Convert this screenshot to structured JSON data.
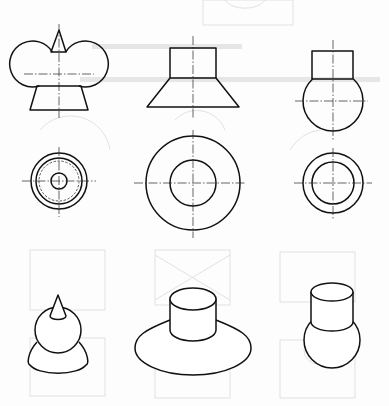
{
  "figure": {
    "colors": {
      "line": "#111111",
      "centerline": "#222222",
      "bleed_through": "#d9d9d9",
      "paper": "#fdfdfd"
    },
    "columns": [
      {
        "id": "A",
        "name": "cone-sphere-frustum",
        "front_view": {
          "cone": {
            "tip": [
              59,
              30
            ],
            "base_y": 52,
            "base_x": [
              51,
              66
            ]
          },
          "sphere": {
            "center": [
              59,
              74
            ],
            "r": 23
          },
          "frustum": {
            "top_y": 86,
            "top_x": [
              37,
              81
            ],
            "bottom_y": 110,
            "bottom_x": [
              30,
              88
            ]
          },
          "axis": {
            "x": 59,
            "y": [
              24,
              118
            ]
          },
          "hline": {
            "y": 74,
            "x": [
              24,
              94
            ]
          }
        },
        "top_view": {
          "center": [
            59,
            181
          ],
          "circles": [
            28,
            23,
            8
          ],
          "hidden_circle": 20,
          "hline": [
            22,
            96
          ],
          "vline": [
            147,
            217
          ]
        },
        "iso_view": {
          "cone_tip": [
            58,
            295
          ],
          "cone_base": {
            "c": [
              58,
              316
            ],
            "rx": 8,
            "ry": 3.5
          },
          "sphere": {
            "c": [
              58,
              330
            ],
            "r": 23
          },
          "frustum_bottom": {
            "c": [
              58,
              365
            ],
            "rx": 29,
            "ry": 11
          }
        }
      },
      {
        "id": "B",
        "name": "cylinder-on-frustum",
        "front_view": {
          "rect": {
            "x": [
              170,
              216
            ],
            "y": [
              48,
              78
            ]
          },
          "frustum": {
            "top_y": 78,
            "top_x": [
              170,
              216
            ],
            "bottom_y": 107,
            "bottom_x": [
              147,
              239
            ]
          },
          "axis": {
            "x": 193,
            "y": [
              36,
              119
            ]
          }
        },
        "top_view": {
          "center": [
            193,
            183
          ],
          "circles": [
            47,
            23
          ],
          "hline": [
            134,
            246
          ],
          "vline": [
            130,
            238
          ]
        },
        "iso_view": {
          "top": {
            "c": [
              193,
              299
            ],
            "rx": 23,
            "ry": 11
          },
          "cyl_bottom_y": 330,
          "base": {
            "c": [
              193,
              348
            ],
            "rx": 58,
            "ry": 27
          },
          "shoulder_y": 320
        }
      },
      {
        "id": "C",
        "name": "cylinder-on-sphere",
        "front_view": {
          "rect": {
            "x": [
              312,
              353
            ],
            "y": [
              51,
              79
            ]
          },
          "sphere": {
            "center": [
              333,
              101
            ],
            "r": 30
          },
          "axis": {
            "x": 333,
            "y": [
              40,
              140
            ]
          },
          "hline": {
            "y": 101,
            "x": [
              295,
              368
            ]
          }
        },
        "top_view": {
          "center": [
            333,
            183
          ],
          "circles": [
            30,
            21
          ],
          "hline": [
            294,
            372
          ],
          "vline": [
            148,
            220
          ]
        },
        "iso_view": {
          "top": {
            "c": [
              332,
              292
            ],
            "rx": 21,
            "ry": 9
          },
          "cyl_bottom_y": 322,
          "sphere": {
            "c": [
              332,
              340
            ],
            "r": 28
          }
        }
      }
    ]
  }
}
